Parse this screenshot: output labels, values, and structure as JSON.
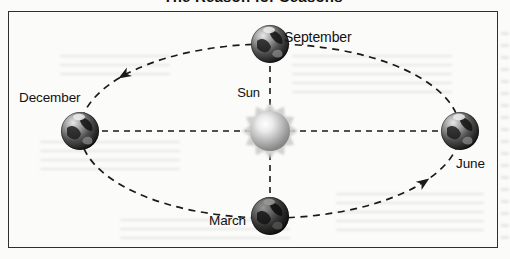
{
  "page": {
    "title": "The Reason for Seasons"
  },
  "diagram": {
    "sun": {
      "label": "Sun",
      "icon": "sun-icon"
    },
    "orbit_positions": [
      {
        "id": "september",
        "label": "September",
        "position": "top",
        "icon": "earth-icon"
      },
      {
        "id": "december",
        "label": "December",
        "position": "left",
        "icon": "earth-icon"
      },
      {
        "id": "june",
        "label": "June",
        "position": "right",
        "icon": "earth-icon"
      },
      {
        "id": "march",
        "label": "March",
        "position": "bottom",
        "icon": "earth-icon"
      }
    ],
    "orbit": {
      "style": "dashed-ellipse",
      "direction": "counterclockwise",
      "arrow_count": 2
    },
    "colors": {
      "line": "#1a1a1a",
      "frame_border": "#2f2f2f",
      "text": "#111111",
      "sun_ray": "#cdcdcd",
      "page_background": "#fbfbfa"
    }
  }
}
